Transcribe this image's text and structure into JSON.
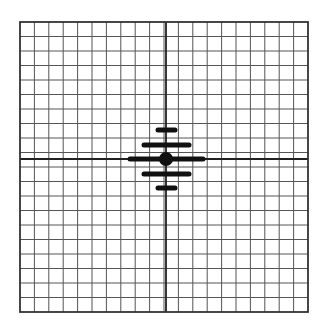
{
  "grid": {
    "left": 20,
    "top": 22,
    "right": 308,
    "bottom": 312,
    "columns": 20,
    "rows": 20,
    "line_color": "#555555",
    "axis_color": "#222222",
    "border_color": "#333333"
  },
  "center_axes": {
    "x": 166,
    "y": 159
  },
  "marker": {
    "dot": {
      "cx": 166,
      "cy": 159,
      "r": 7,
      "color": "#111111"
    },
    "bars": [
      {
        "x1": 158,
        "x2": 175,
        "y": 130
      },
      {
        "x1": 144,
        "x2": 189,
        "y": 145
      },
      {
        "x1": 130,
        "x2": 203,
        "y": 159
      },
      {
        "x1": 144,
        "x2": 189,
        "y": 174
      },
      {
        "x1": 158,
        "x2": 175,
        "y": 188
      }
    ],
    "bar_thickness": 5,
    "bar_color": "#111111"
  }
}
